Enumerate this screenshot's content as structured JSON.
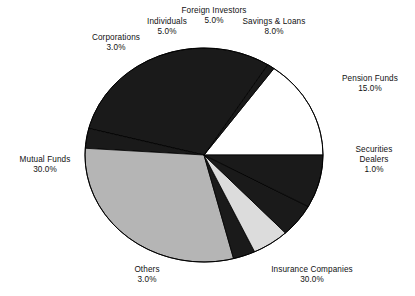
{
  "chart_data": {
    "type": "pie",
    "title": "",
    "subtitle": "",
    "xlabel": "",
    "ylabel": "",
    "legend_position": "none",
    "grid": false,
    "value_suffix": "%",
    "label_format": "name above value",
    "total": 100.0,
    "categories": [
      "Pension Funds",
      "Securities Dealers",
      "Insurance Companies",
      "Others",
      "Mutual Funds",
      "Corporations",
      "Individuals",
      "Foreign Investors",
      "Savings & Loans"
    ],
    "values": [
      15.0,
      1.0,
      30.0,
      3.0,
      30.0,
      3.0,
      5.0,
      5.0,
      8.0
    ],
    "value_labels": [
      "15.0%",
      "1.0%",
      "30.0%",
      "3.0%",
      "30.0%",
      "3.0%",
      "5.0%",
      "5.0%",
      "8.0%"
    ],
    "slice_fills": [
      "white",
      "black",
      "black",
      "black",
      "gray",
      "black",
      "light-gray",
      "black",
      "black"
    ],
    "colors": {
      "white": "#ffffff",
      "black": "#1a1a1a",
      "gray": "#b5b5b5",
      "light-gray": "#dcdcdc",
      "outline": "#000000",
      "text": "#111111",
      "background": "#ffffff"
    },
    "slices": [
      {
        "name": "Pension Funds",
        "value": 15.0,
        "value_label": "15.0%",
        "fill": "white"
      },
      {
        "name": "Securities Dealers",
        "value": 1.0,
        "value_label": "1.0%",
        "fill": "black"
      },
      {
        "name": "Insurance Companies",
        "value": 30.0,
        "value_label": "30.0%",
        "fill": "black"
      },
      {
        "name": "Others",
        "value": 3.0,
        "value_label": "3.0%",
        "fill": "black"
      },
      {
        "name": "Mutual Funds",
        "value": 30.0,
        "value_label": "30.0%",
        "fill": "gray"
      },
      {
        "name": "Corporations",
        "value": 3.0,
        "value_label": "3.0%",
        "fill": "black"
      },
      {
        "name": "Individuals",
        "value": 5.0,
        "value_label": "5.0%",
        "fill": "light-gray"
      },
      {
        "name": "Foreign Investors",
        "value": 5.0,
        "value_label": "5.0%",
        "fill": "black"
      },
      {
        "name": "Savings & Loans",
        "value": 8.0,
        "value_label": "8.0%",
        "fill": "black"
      }
    ]
  },
  "labels": {
    "corporations": {
      "name": "Corporations",
      "value": "3.0%"
    },
    "individuals": {
      "name": "Individuals",
      "value": "5.0%"
    },
    "foreign_investors": {
      "name": "Foreign Investors",
      "value": "5.0%"
    },
    "savings_and_loans": {
      "name": "Savings & Loans",
      "value": "8.0%"
    },
    "pension_funds": {
      "name": "Pension Funds",
      "value": "15.0%"
    },
    "securities_dealers": {
      "name_line1": "Securities",
      "name_line2": "Dealers",
      "value": "1.0%"
    },
    "insurance_companies": {
      "name": "Insurance Companies",
      "value": "30.0%"
    },
    "others": {
      "name": "Others",
      "value": "3.0%"
    },
    "mutual_funds": {
      "name": "Mutual Funds",
      "value": "30.0%"
    }
  }
}
